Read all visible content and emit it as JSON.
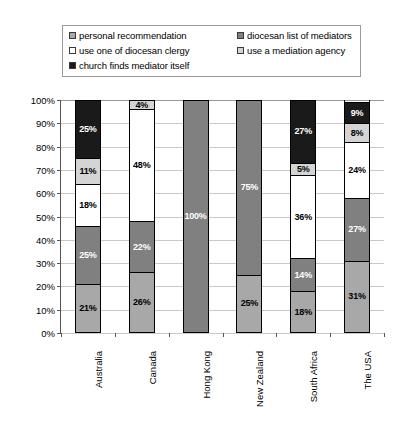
{
  "legend": {
    "entries": [
      {
        "label": "personal recommendation",
        "color": "#a8a8a8",
        "swatch": "legend-swatch-personal-recommendation"
      },
      {
        "label": "diocesan list of mediators",
        "color": "#808080",
        "swatch": "legend-swatch-diocesan-list"
      },
      {
        "label": "use one of diocesan clergy",
        "color": "#ffffff",
        "swatch": "legend-swatch-diocesan-clergy"
      },
      {
        "label": "use a mediation agency",
        "color": "#d4d4d4",
        "swatch": "legend-swatch-mediation-agency"
      },
      {
        "label": "church finds mediator itself",
        "color": "#1a1a1a",
        "swatch": "legend-swatch-church-finds-mediator"
      }
    ]
  },
  "chart_data": {
    "type": "bar",
    "stacked": true,
    "title": "",
    "xlabel": "",
    "ylabel": "",
    "ylim": [
      0,
      100
    ],
    "ytick_labels": [
      "0%",
      "10%",
      "20%",
      "30%",
      "40%",
      "50%",
      "60%",
      "70%",
      "80%",
      "90%",
      "100%"
    ],
    "ytick_values": [
      0,
      10,
      20,
      30,
      40,
      50,
      60,
      70,
      80,
      90,
      100
    ],
    "grid": true,
    "legend_position": "top",
    "categories": [
      "Australia",
      "Canada",
      "Hong Kong",
      "New Zealand",
      "South Africa",
      "The USA"
    ],
    "series": [
      {
        "name": "personal recommendation",
        "color": "#a8a8a8",
        "text_color": "dark",
        "values": [
          21,
          26,
          0,
          25,
          18,
          31
        ],
        "labels": [
          "21%",
          "26%",
          "",
          "25%",
          "18%",
          "31%"
        ]
      },
      {
        "name": "diocesan list of mediators",
        "color": "#808080",
        "text_color": "light",
        "values": [
          25,
          22,
          100,
          75,
          14,
          27
        ],
        "labels": [
          "25%",
          "22%",
          "100%",
          "75%",
          "14%",
          "27%"
        ]
      },
      {
        "name": "use one of diocesan clergy",
        "color": "#ffffff",
        "text_color": "dark",
        "values": [
          18,
          48,
          0,
          0,
          36,
          24
        ],
        "labels": [
          "18%",
          "48%",
          "",
          "",
          "36%",
          "24%"
        ]
      },
      {
        "name": "use a mediation agency",
        "color": "#d4d4d4",
        "text_color": "dark",
        "values": [
          11,
          4,
          0,
          0,
          5,
          8
        ],
        "labels": [
          "11%",
          "4%",
          "",
          "",
          "5%",
          "8%"
        ]
      },
      {
        "name": "church finds mediator itself",
        "color": "#1a1a1a",
        "text_color": "light",
        "values": [
          25,
          0,
          0,
          0,
          27,
          9
        ],
        "labels": [
          "25%",
          "",
          "",
          "",
          "27%",
          "9%"
        ]
      }
    ]
  }
}
